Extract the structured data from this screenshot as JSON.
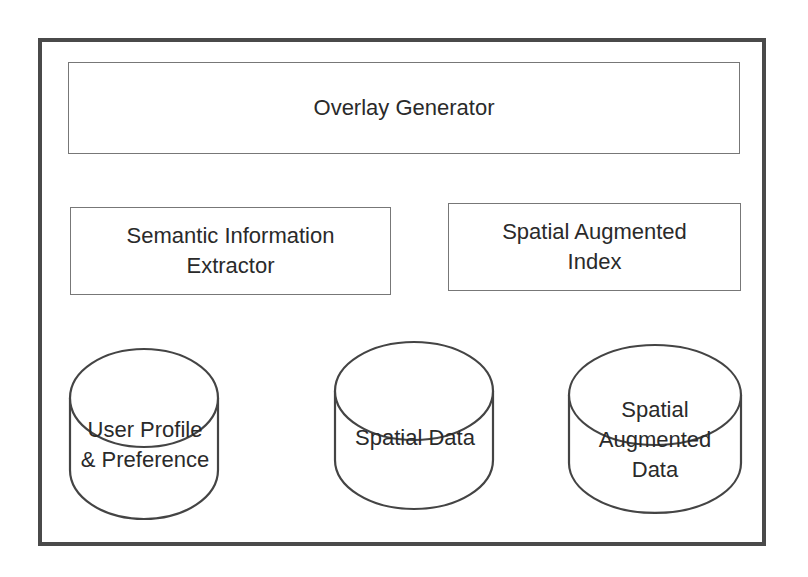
{
  "diagram": {
    "components": {
      "overlay_generator": "Overlay Generator",
      "semantic_extractor_line1": "Semantic Information",
      "semantic_extractor_line2": "Extractor",
      "spatial_index_line1": "Spatial Augmented",
      "spatial_index_line2": "Index"
    },
    "data_stores": {
      "user_profile_line1": "User Profile",
      "user_profile_line2": "& Preference",
      "spatial_data": "Spatial Data",
      "spatial_aug_line1": "Spatial",
      "spatial_aug_line2": "Augmented",
      "spatial_aug_line3": "Data"
    },
    "colors": {
      "frame": "#4a4a4a",
      "box_border": "#777777",
      "text": "#2a2a2a"
    }
  }
}
